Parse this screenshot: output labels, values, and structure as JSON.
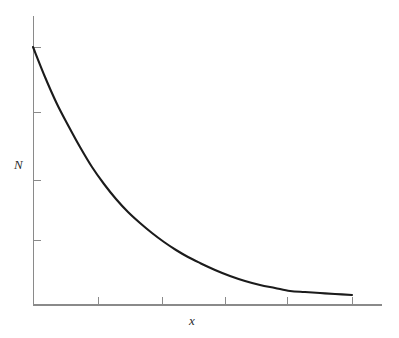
{
  "figure": {
    "width": 399,
    "height": 338,
    "background_color": "#ffffff"
  },
  "labels": {
    "y_axis_label": "N",
    "x_axis_label": "x"
  },
  "style": {
    "curve_color": "#1b1b1b",
    "axis_color": "#8a8a8a",
    "curve_width": 2.1
  },
  "axes": {
    "origin_px": [
      33,
      305
    ],
    "y_axis_top_px": 16,
    "x_axis_right_px": 382,
    "y_tick_positions_px": [
      47,
      112,
      180,
      240
    ],
    "x_tick_positions_px": [
      98,
      162,
      225,
      287,
      352
    ],
    "tick_length_px": 7,
    "tick_direction": "inward",
    "grid": false,
    "tick_labels_shown": false
  },
  "chart_data": {
    "type": "line",
    "title": "",
    "subtitle": "",
    "xlabel": "x",
    "ylabel": "N",
    "legend": [],
    "legend_position": "none",
    "grid": false,
    "xlim": [
      0,
      10.94
    ],
    "ylim": [
      0,
      1.12
    ],
    "x_tick_labels": [],
    "y_tick_labels": [],
    "annotations": [],
    "series": [
      {
        "name": "N(x)",
        "description": "exponential decay N = N0 * exp(-k x)",
        "N0": 1.0,
        "k": 0.326,
        "x": [
          0.0,
          0.5,
          1.0,
          1.5,
          2.0,
          2.5,
          3.0,
          3.5,
          4.0,
          4.5,
          5.0,
          5.5,
          6.0,
          6.5,
          7.0,
          7.5,
          8.0,
          8.5,
          9.0,
          9.5,
          10.0,
          10.5,
          10.94
        ],
        "values": [
          1.0,
          0.85,
          0.722,
          0.613,
          0.521,
          0.443,
          0.376,
          0.319,
          0.271,
          0.23,
          0.196,
          0.166,
          0.141,
          0.12,
          0.102,
          0.087,
          0.074,
          0.063,
          0.053,
          0.045,
          0.038,
          0.033,
          0.029
        ]
      }
    ],
    "pixel_path": [
      [
        33,
        47
      ],
      [
        45,
        77
      ],
      [
        57,
        104
      ],
      [
        69,
        127
      ],
      [
        80,
        147
      ],
      [
        92,
        167
      ],
      [
        104,
        184
      ],
      [
        116,
        199
      ],
      [
        128,
        212
      ],
      [
        140,
        223
      ],
      [
        152,
        233
      ],
      [
        164,
        242
      ],
      [
        176,
        250
      ],
      [
        188,
        257
      ],
      [
        200,
        263
      ],
      [
        215,
        270
      ],
      [
        230,
        276
      ],
      [
        245,
        281
      ],
      [
        260,
        285
      ],
      [
        275,
        288
      ],
      [
        290,
        291
      ],
      [
        305,
        292
      ],
      [
        320,
        293
      ],
      [
        335,
        294
      ],
      [
        352,
        295
      ]
    ]
  }
}
